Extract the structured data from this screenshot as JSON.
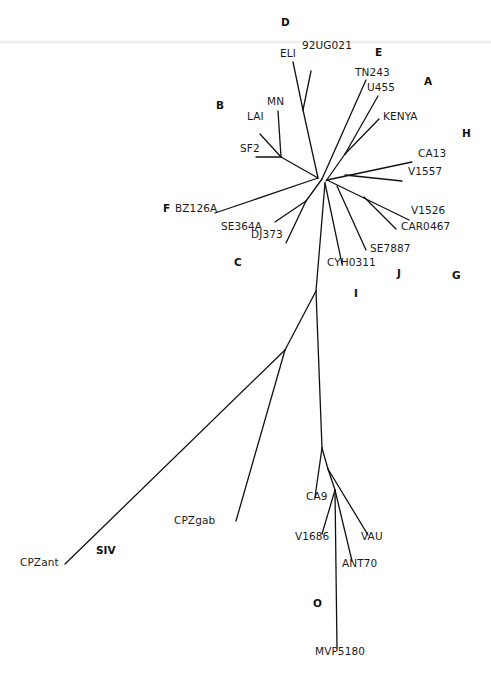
{
  "diagram": {
    "type": "unrooted phylogenetic tree",
    "line_color": "#111111",
    "clade_labels": [
      {
        "text": "D",
        "x": 281,
        "y": 26
      },
      {
        "text": "E",
        "x": 375,
        "y": 56
      },
      {
        "text": "A",
        "x": 424,
        "y": 85
      },
      {
        "text": "B",
        "x": 216,
        "y": 109
      },
      {
        "text": "H",
        "x": 462,
        "y": 137
      },
      {
        "text": "F",
        "x": 163,
        "y": 212
      },
      {
        "text": "C",
        "x": 234,
        "y": 266
      },
      {
        "text": "G",
        "x": 452,
        "y": 279
      },
      {
        "text": "J",
        "x": 397,
        "y": 277
      },
      {
        "text": "I",
        "x": 354,
        "y": 297
      },
      {
        "text": "SIV",
        "x": 96,
        "y": 554
      },
      {
        "text": "O",
        "x": 313,
        "y": 607
      }
    ],
    "taxa": [
      {
        "text": "92UG021",
        "x": 302,
        "y": 49
      },
      {
        "text": "ELI",
        "x": 280,
        "y": 57
      },
      {
        "text": "TN243",
        "x": 355,
        "y": 76
      },
      {
        "text": "U455",
        "x": 367,
        "y": 91
      },
      {
        "text": "MN",
        "x": 267,
        "y": 105
      },
      {
        "text": "LAI",
        "x": 247,
        "y": 120
      },
      {
        "text": "KENYA",
        "x": 383,
        "y": 120
      },
      {
        "text": "SF2",
        "x": 240,
        "y": 152
      },
      {
        "text": "CA13",
        "x": 418,
        "y": 157
      },
      {
        "text": "V1557",
        "x": 408,
        "y": 175
      },
      {
        "text": "BZ126A",
        "x": 175,
        "y": 212
      },
      {
        "text": "V1526",
        "x": 411,
        "y": 214
      },
      {
        "text": "SE364A",
        "x": 221,
        "y": 230
      },
      {
        "text": "CAR0467",
        "x": 401,
        "y": 230
      },
      {
        "text": "DJ373",
        "x": 251,
        "y": 238
      },
      {
        "text": "SE7887",
        "x": 370,
        "y": 252
      },
      {
        "text": "CYH0311",
        "x": 327,
        "y": 266
      },
      {
        "text": "CA9",
        "x": 306,
        "y": 500
      },
      {
        "text": "CPZgab",
        "x": 174,
        "y": 524
      },
      {
        "text": "V1686",
        "x": 295,
        "y": 540
      },
      {
        "text": "VAU",
        "x": 361,
        "y": 540
      },
      {
        "text": "CPZant",
        "x": 20,
        "y": 566
      },
      {
        "text": "ANT70",
        "x": 342,
        "y": 567
      },
      {
        "text": "MVP5180",
        "x": 315,
        "y": 655
      }
    ],
    "branches": [
      [
        318,
        178,
        303,
        110
      ],
      [
        303,
        110,
        311,
        71
      ],
      [
        303,
        110,
        293,
        62
      ],
      [
        318,
        178,
        281,
        157
      ],
      [
        281,
        157,
        278,
        111
      ],
      [
        281,
        157,
        260,
        134
      ],
      [
        281,
        157,
        256,
        157
      ],
      [
        322,
        179,
        366,
        80
      ],
      [
        326,
        181,
        345,
        154
      ],
      [
        345,
        154,
        378,
        96
      ],
      [
        345,
        154,
        379,
        119
      ],
      [
        327,
        180,
        412,
        162
      ],
      [
        345,
        175,
        402,
        181
      ],
      [
        318,
        178,
        215,
        213
      ],
      [
        322,
        179,
        306,
        201
      ],
      [
        306,
        201,
        275,
        222
      ],
      [
        306,
        201,
        286,
        243
      ],
      [
        327,
        180,
        409,
        220
      ],
      [
        364,
        197,
        396,
        229
      ],
      [
        337,
        186,
        366,
        250
      ],
      [
        325,
        183,
        342,
        264
      ],
      [
        325,
        183,
        316,
        291
      ],
      [
        316,
        291,
        322,
        448
      ],
      [
        316,
        291,
        285,
        350
      ],
      [
        285,
        350,
        65,
        564
      ],
      [
        285,
        350,
        236,
        521
      ],
      [
        322,
        448,
        315,
        497
      ],
      [
        322,
        448,
        328,
        469
      ],
      [
        328,
        469,
        368,
        535
      ],
      [
        328,
        469,
        335,
        490
      ],
      [
        335,
        490,
        322,
        534
      ],
      [
        335,
        490,
        352,
        561
      ],
      [
        335,
        490,
        337,
        648
      ]
    ]
  }
}
